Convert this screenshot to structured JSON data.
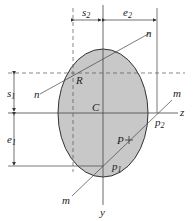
{
  "diagram": {
    "colors": {
      "fill": "#c8c8c8",
      "stroke": "#333333",
      "line": "#444444"
    },
    "dimensions": {
      "s2": {
        "base": "s",
        "sub": "2"
      },
      "e2": {
        "base": "e",
        "sub": "2"
      },
      "s1": {
        "base": "s",
        "sub": "1"
      },
      "e1": {
        "base": "e",
        "sub": "1"
      }
    },
    "points": {
      "R": "R",
      "C": "C",
      "P": "P",
      "p1": {
        "base": "p",
        "sub": "1"
      },
      "p2": {
        "base": "p",
        "sub": "2"
      }
    },
    "axes": {
      "z": "z",
      "y": "y"
    },
    "lines": {
      "n_top": "n",
      "n_bottom": "n",
      "m_top": "m",
      "m_bottom": "m"
    }
  }
}
